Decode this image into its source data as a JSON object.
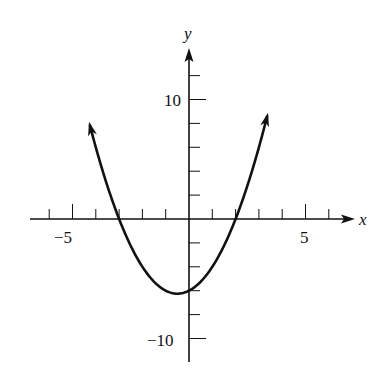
{
  "chart_data": {
    "type": "line",
    "title": "",
    "xlabel": "x",
    "ylabel": "y",
    "function": "y = x^2 + x - 6",
    "x_tick_labels": [
      "-5",
      "5"
    ],
    "y_tick_labels": [
      "10",
      "-10"
    ],
    "xlim": [
      -7,
      7
    ],
    "ylim": [
      -11.5,
      14
    ],
    "x_ticks": [
      -6,
      -5,
      -4,
      -3,
      -2,
      -1,
      1,
      2,
      3,
      4,
      5,
      6
    ],
    "y_ticks": [
      -10,
      -9,
      -8,
      -7,
      -6,
      -5,
      -4,
      -3,
      -2,
      -1,
      1,
      2,
      3,
      4,
      5,
      6,
      7,
      8,
      9,
      10,
      11,
      12
    ],
    "grid": false,
    "legend": null,
    "series": [
      {
        "name": "parabola",
        "x": [
          -4.25,
          -4,
          -3.5,
          -3,
          -2.5,
          -2,
          -1.5,
          -1,
          -0.5,
          0,
          0.5,
          1,
          1.5,
          2,
          2.5,
          3,
          3.35
        ],
        "values": [
          7.81,
          6,
          2.75,
          0,
          -2.25,
          -4,
          -5.25,
          -6,
          -6.25,
          -6,
          -5.25,
          -4,
          -2.25,
          0,
          2.75,
          6,
          8.57
        ]
      }
    ],
    "annotations": {
      "roots": [
        -3,
        2
      ],
      "y_intercept": -6,
      "vertex": [
        -0.5,
        -6.25
      ],
      "arrows_on_ends": true
    }
  },
  "labels": {
    "x_axis": "x",
    "y_axis": "y",
    "x_neg5": "−5",
    "x_pos5": "5",
    "y_pos10": "10",
    "y_neg10": "−10"
  },
  "colors": {
    "ink": "#111111",
    "background": "#ffffff"
  }
}
